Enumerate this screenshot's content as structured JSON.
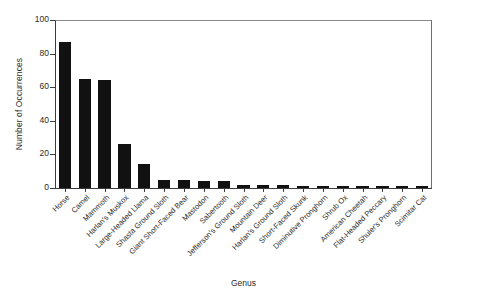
{
  "chart_data": {
    "type": "bar",
    "title": "",
    "xlabel": "Genus",
    "ylabel": "Number of Occurrences",
    "ylim": [
      0,
      100
    ],
    "yticks": [
      0,
      20,
      40,
      60,
      80,
      100
    ],
    "grid": false,
    "legend": null,
    "bar_color": "#111111",
    "categories": [
      "Horse",
      "Camel",
      "Mammoth",
      "Harlan's Muskox",
      "Large-Headed Llama",
      "Shasta Ground Sloth",
      "Giant Short-Faced Bear",
      "Mastodon",
      "Sabertooth",
      "Jefferson's Ground Sloth",
      "Mountain Deer",
      "Harlan's Ground Sloth",
      "Short-Faced Skunk",
      "Diminutive Pronghorn",
      "Shrub Ox",
      "American Cheetah",
      "Flat-Headed Peccary",
      "Shuler's Pronghorn",
      "Scimitar Cat"
    ],
    "values": [
      87,
      65,
      64,
      26,
      14,
      5,
      5,
      4,
      4,
      2,
      2,
      2,
      1,
      1,
      1,
      1,
      1,
      1,
      1
    ]
  }
}
